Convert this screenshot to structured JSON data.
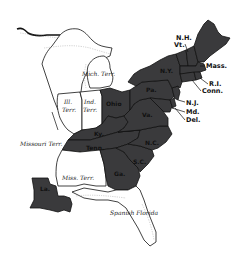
{
  "map": {
    "colors": {
      "state_fill": "#3a3a3c",
      "territory_fill": "#ffffff",
      "border": "#111111",
      "background": "#ffffff"
    },
    "states": [
      {
        "id": "nh",
        "label": "N.H."
      },
      {
        "id": "vt",
        "label": "Vt."
      },
      {
        "id": "mass",
        "label": "Mass."
      },
      {
        "id": "ri",
        "label": "R.I."
      },
      {
        "id": "conn",
        "label": "Conn."
      },
      {
        "id": "ny",
        "label": "N.Y."
      },
      {
        "id": "nj",
        "label": "N.J."
      },
      {
        "id": "pa",
        "label": "Pa."
      },
      {
        "id": "md",
        "label": "Md."
      },
      {
        "id": "del",
        "label": "Del."
      },
      {
        "id": "ohio",
        "label": "Ohio"
      },
      {
        "id": "va",
        "label": "Va."
      },
      {
        "id": "ky",
        "label": "Ky."
      },
      {
        "id": "tenn",
        "label": "Tenn."
      },
      {
        "id": "nc",
        "label": "N.C."
      },
      {
        "id": "sc",
        "label": "S.C."
      },
      {
        "id": "ga",
        "label": "Ga."
      },
      {
        "id": "la",
        "label": "La."
      }
    ],
    "territories": [
      {
        "id": "mich",
        "label": "Mich. Terr."
      },
      {
        "id": "ill",
        "label_line1": "Ill.",
        "label_line2": "Terr."
      },
      {
        "id": "ind",
        "label_line1": "Ind.",
        "label_line2": "Terr."
      },
      {
        "id": "missouri",
        "label": "Missouri Terr."
      },
      {
        "id": "miss",
        "label": "Miss. Terr."
      },
      {
        "id": "florida",
        "label": "Spanish Florida"
      }
    ]
  }
}
